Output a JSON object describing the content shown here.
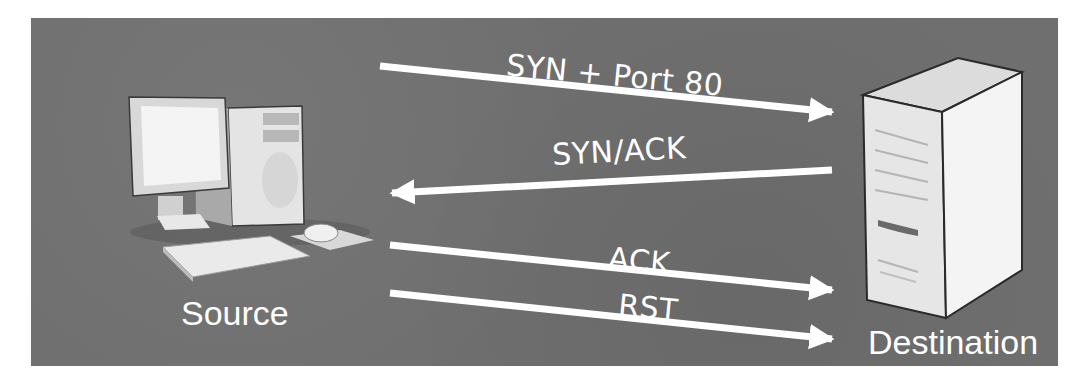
{
  "diagram": {
    "background_color": "#6f6f6f",
    "arrow_color": "#ffffff",
    "nodes": [
      {
        "id": "source",
        "label": "Source",
        "icon": "desktop-computer-icon"
      },
      {
        "id": "destination",
        "label": "Destination",
        "icon": "server-tower-icon"
      }
    ],
    "messages": [
      {
        "label": "SYN + Port 80",
        "from": "source",
        "to": "destination"
      },
      {
        "label": "SYN/ACK",
        "from": "destination",
        "to": "source"
      },
      {
        "label": "ACK",
        "from": "source",
        "to": "destination"
      },
      {
        "label": "RST",
        "from": "source",
        "to": "destination"
      }
    ]
  }
}
